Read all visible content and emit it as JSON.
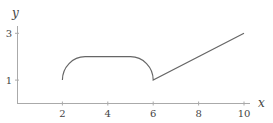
{
  "chart_data": {
    "type": "line",
    "title": "",
    "xlabel": "x",
    "ylabel": "y",
    "xlim": [
      0,
      10.2
    ],
    "ylim": [
      0,
      3.1
    ],
    "xticks": [
      2,
      4,
      6,
      8,
      10
    ],
    "yticks": [
      1,
      3
    ],
    "grid": false,
    "legend": null,
    "series": [
      {
        "name": "f(x)",
        "description": "quarter arc (2,1)->(3,2), flat (3,2)->(5,2), quarter arc (5,2)->(6,1), line (6,1)->(10,3)",
        "points": [
          [
            2,
            1
          ],
          [
            2.13,
            1.5
          ],
          [
            2.5,
            1.87
          ],
          [
            3,
            2
          ],
          [
            4,
            2
          ],
          [
            5,
            2
          ],
          [
            5.5,
            1.87
          ],
          [
            5.87,
            1.5
          ],
          [
            6,
            1
          ],
          [
            8,
            2
          ],
          [
            10,
            3
          ]
        ]
      }
    ],
    "colors": {
      "axis": "#999999",
      "line": "#666666",
      "text": "#444444"
    }
  }
}
